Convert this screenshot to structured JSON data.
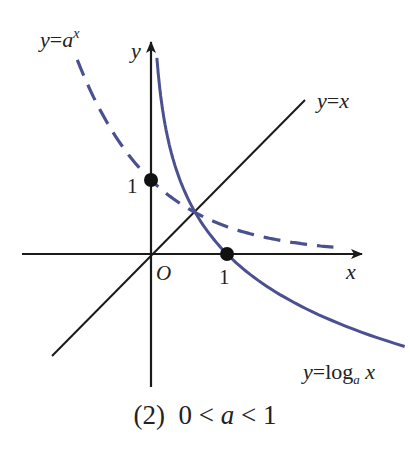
{
  "figure": {
    "caption_prefix": "(2)",
    "caption_condition_left": "0 <",
    "caption_var": "a",
    "caption_condition_right": "< 1",
    "caption_full": "(2)  0 < a < 1"
  },
  "axes": {
    "x_label": "x",
    "y_label": "y",
    "origin_label": "O",
    "x_tick_label": "1",
    "y_tick_label": "1"
  },
  "curves": [
    {
      "id": "exp",
      "label_y": "y",
      "label_eq": "=",
      "label_base": "a",
      "label_exp": "x",
      "label_full": "y=a^x",
      "style": "dashed",
      "color": "#4b5190"
    },
    {
      "id": "log",
      "label_y": "y",
      "label_eq": "=",
      "label_fn": "log",
      "label_sub": "a",
      "label_arg": "x",
      "label_full": "y=log_a x",
      "style": "solid",
      "color": "#4b5190"
    },
    {
      "id": "identity",
      "label_y": "y",
      "label_eq": "=",
      "label_x": "x",
      "label_full": "y=x",
      "style": "solid",
      "color": "#1a1a1a"
    }
  ],
  "points": [
    {
      "label": "(0,1)",
      "on": "y=a^x"
    },
    {
      "label": "(1,0)",
      "on": "y=log_a x"
    }
  ],
  "colors": {
    "curve": "#4b5190",
    "axis": "#1a1a1a"
  }
}
